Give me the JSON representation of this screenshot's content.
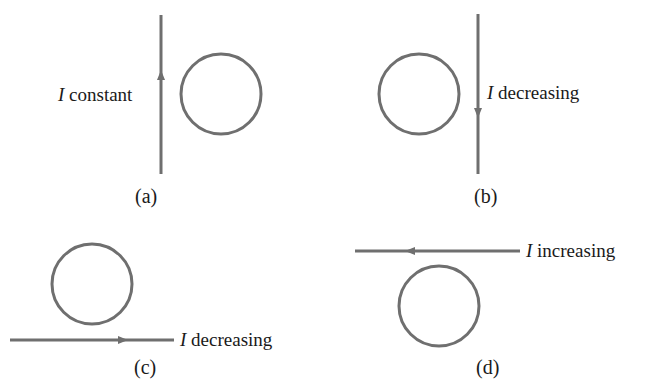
{
  "panels": [
    {
      "id": "a",
      "caption": "(a)",
      "symbol": "I",
      "label": " constant",
      "wire": "vertical",
      "current_direction": "up"
    },
    {
      "id": "b",
      "caption": "(b)",
      "symbol": "I",
      "label": " decreasing",
      "wire": "vertical",
      "current_direction": "down"
    },
    {
      "id": "c",
      "caption": "(c)",
      "symbol": "I",
      "label": " decreasing",
      "wire": "horizontal",
      "current_direction": "right"
    },
    {
      "id": "d",
      "caption": "(d)",
      "symbol": "I",
      "label": " increasing",
      "wire": "horizontal",
      "current_direction": "left"
    }
  ],
  "colors": {
    "stroke": "#6f6f6f",
    "text": "#1a1a1a"
  }
}
